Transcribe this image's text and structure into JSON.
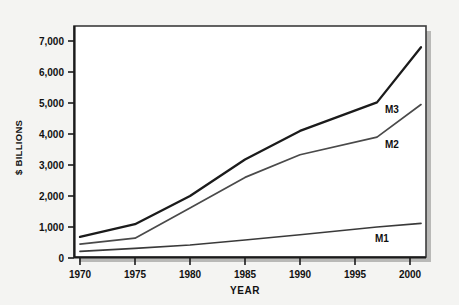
{
  "chart_data": {
    "type": "line",
    "title": "",
    "xlabel": "YEAR",
    "ylabel": "$ BILLIONS",
    "x": [
      1970,
      1975,
      1980,
      1985,
      1990,
      1997,
      2001
    ],
    "xlim": [
      1969,
      2001.5
    ],
    "ylim": [
      0,
      7500
    ],
    "grid": false,
    "legend_position": "inline-right",
    "xticks": [
      "1970",
      "1975",
      "1980",
      "1985",
      "1990",
      "1995",
      "2000"
    ],
    "xtick_values": [
      1970,
      1975,
      1980,
      1985,
      1990,
      1995,
      2000
    ],
    "yticks": [
      "0",
      "1,000",
      "2,000",
      "3,000",
      "4,000",
      "5,000",
      "6,000",
      "7,000"
    ],
    "ytick_values": [
      0,
      1000,
      2000,
      3000,
      4000,
      5000,
      6000,
      7000
    ],
    "series": [
      {
        "name": "M3",
        "label": "M3",
        "color": "#1b1b1b",
        "values": [
          680,
          1090,
          2000,
          3180,
          4100,
          5020,
          6800
        ]
      },
      {
        "name": "M2",
        "label": "M2",
        "color": "#4a4a4a",
        "values": [
          450,
          640,
          1610,
          2600,
          3330,
          3900,
          4950
        ]
      },
      {
        "name": "M1",
        "label": "M1",
        "color": "#3a3a3a",
        "values": [
          215,
          310,
          420,
          580,
          750,
          1000,
          1120
        ]
      }
    ]
  },
  "colors": {
    "page_background": "#f4f4f2",
    "plot_background": "#ffffff",
    "plot_border": "#3c3c3c",
    "shadow": "#b9b9b7",
    "text": "#111111"
  }
}
